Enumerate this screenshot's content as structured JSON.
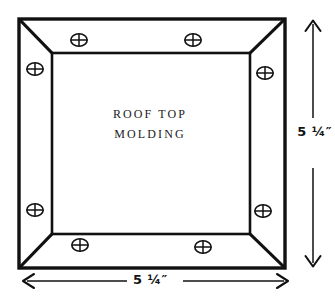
{
  "drawing": {
    "title_lines": [
      "ROOF TOP",
      "MOLDING"
    ],
    "line_color": "#111111",
    "fill_color": "#ffffff",
    "background": "#ffffff"
  },
  "dimensions": {
    "vertical": {
      "label": "5 ¼″",
      "name": "height"
    },
    "horizontal": {
      "label": "5 ¼″",
      "name": "width"
    }
  },
  "fasteners": {
    "icon": "screw-cross-icon",
    "count": 8,
    "positions": [
      {
        "id": "top-left",
        "cx": 79,
        "cy": 40
      },
      {
        "id": "top-right",
        "cx": 193,
        "cy": 40
      },
      {
        "id": "left-upper",
        "cx": 35,
        "cy": 69
      },
      {
        "id": "right-upper",
        "cx": 265,
        "cy": 73
      },
      {
        "id": "left-lower",
        "cx": 35,
        "cy": 210
      },
      {
        "id": "right-lower",
        "cx": 263,
        "cy": 211
      },
      {
        "id": "bottom-left",
        "cx": 80,
        "cy": 245
      },
      {
        "id": "bottom-right",
        "cx": 203,
        "cy": 247
      }
    ]
  },
  "geometry": {
    "outer": {
      "left": 19,
      "top": 19,
      "right": 285,
      "bottom": 268
    },
    "inner": {
      "left": 52,
      "top": 53,
      "right": 250,
      "bottom": 234
    }
  }
}
